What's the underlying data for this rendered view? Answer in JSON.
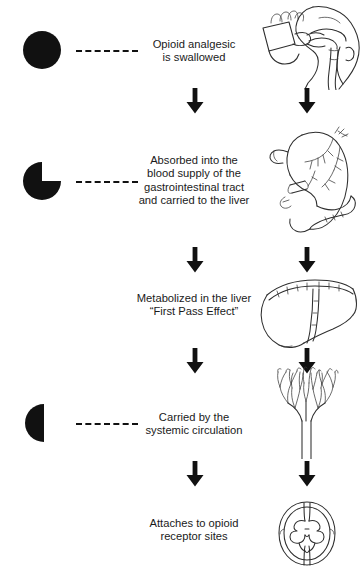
{
  "diagram": {
    "ink_color": "#2e2e2e",
    "arrow_color": "#111111",
    "drug_color": "#111111",
    "stages": [
      {
        "id": "swallowed",
        "drug_icon": "full-circle-tablet-icon",
        "drug_state": "whole dose",
        "text_lines": [
          "Opioid analgesic",
          "is swallowed"
        ],
        "illustration": "head-swallowing-icon",
        "illustration_label": "Head in profile drinking from a cup with pharynx and esophagus shown",
        "has_dashed_connector": true
      },
      {
        "id": "absorbed",
        "drug_icon": "three-quarter-circle-tablet-icon",
        "drug_state": "partially absorbed",
        "text_lines": [
          "Absorbed into the",
          "blood supply of the",
          "gastrointestinal tract",
          "and carried to the liver"
        ],
        "illustration": "stomach-icon",
        "illustration_label": "Stomach with gastric blood vessels",
        "has_dashed_connector": true
      },
      {
        "id": "metabolized",
        "drug_icon": "none",
        "drug_state": "",
        "text_lines": [
          "Metabolized in the liver",
          "“First Pass Effect”"
        ],
        "illustration": "liver-icon",
        "illustration_label": "Liver with right and left lobes and falciform ligament",
        "has_dashed_connector": false
      },
      {
        "id": "circulated",
        "drug_icon": "half-circle-tablet-icon",
        "drug_state": "half dose remaining",
        "text_lines": [
          "Carried by the",
          "systemic circulation"
        ],
        "illustration": "vascular-tree-icon",
        "illustration_label": "Branching vascular capillary tree",
        "has_dashed_connector": true
      },
      {
        "id": "receptors",
        "drug_icon": "none",
        "drug_state": "",
        "text_lines": [
          "Attaches to opioid",
          "receptor sites"
        ],
        "illustration": "spinal-cord-cross-section-icon",
        "illustration_label": "Spinal cord cross section with butterfly shaped gray matter",
        "has_dashed_connector": false
      }
    ],
    "arrows": {
      "glyph": "down-arrow-icon",
      "count": 8,
      "columns": [
        "center",
        "right"
      ]
    }
  }
}
